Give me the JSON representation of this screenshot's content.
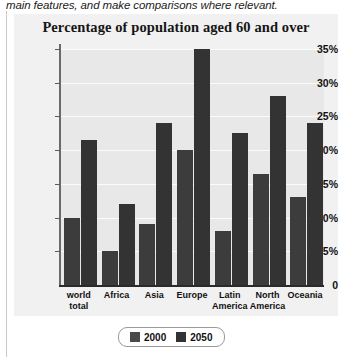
{
  "instruction": {
    "text": "main features, and make comparisons where relevant."
  },
  "chart_data": {
    "type": "bar",
    "title": "Percentage of population aged 60 and over",
    "xlabel": "",
    "ylabel": "",
    "ylim": [
      0,
      35
    ],
    "ytick_labels": [
      "35%",
      "30%",
      "25%",
      "20%",
      "15%",
      "10%",
      "5%",
      "0"
    ],
    "ytick_values": [
      35,
      30,
      25,
      20,
      15,
      10,
      5,
      0
    ],
    "grid": true,
    "legend_position": "bottom",
    "categories": [
      "world total",
      "Africa",
      "Asia",
      "Europe",
      "Latin America",
      "North America",
      "Oceania"
    ],
    "series": [
      {
        "name": "2000",
        "color": "#3c3c3c",
        "values": [
          10,
          5,
          9,
          20,
          8,
          16.5,
          13
        ]
      },
      {
        "name": "2050",
        "color": "#333333",
        "values": [
          21.5,
          12,
          24,
          35,
          22.5,
          28,
          24
        ]
      }
    ]
  },
  "legend": {
    "items": [
      {
        "label": "2000",
        "color": "#4a4a4a"
      },
      {
        "label": "2050",
        "color": "#333333"
      }
    ]
  }
}
